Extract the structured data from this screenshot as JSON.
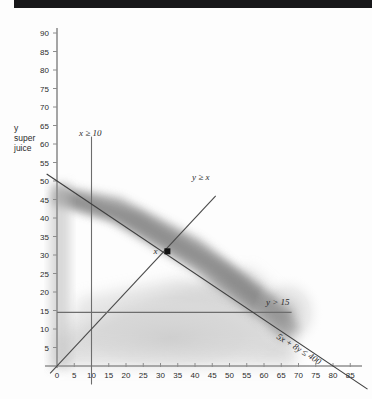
{
  "page": {
    "top_bar_color": "#18181a",
    "background_color": "#fdfdfd"
  },
  "chart_data": {
    "type": "scatter",
    "title": "",
    "subtitle": "",
    "xlabel": "",
    "ylabel": "y\nsuper\njuice",
    "ylabel_lines": [
      "y",
      "super",
      "juice"
    ],
    "xlim": [
      0,
      92
    ],
    "ylim": [
      0,
      93
    ],
    "xticks": [
      0,
      5,
      10,
      15,
      20,
      25,
      30,
      35,
      40,
      45,
      50,
      55,
      60,
      65,
      70,
      75,
      80,
      85
    ],
    "yticks": [
      5,
      10,
      15,
      20,
      25,
      30,
      35,
      40,
      45,
      50,
      55,
      60,
      65,
      70,
      75,
      80,
      85,
      90
    ],
    "grid": false,
    "legend_position": "inline-annotations",
    "axis_color": "#8c8c8c",
    "line_color": "#3a3a3a",
    "shade_color": "#b9b9b9",
    "constraint_lines": [
      {
        "name": "x-ge-10",
        "label": "x ≥ 10",
        "type": "vertical",
        "value": 10,
        "label_x": 14,
        "label_y": 62
      },
      {
        "name": "y-ge-x",
        "label": "y ≥ x",
        "type": "identity",
        "slope": 1,
        "intercept": 0,
        "label_x": 50,
        "label_y": 48
      },
      {
        "name": "y-ge-15",
        "label": "y > 15",
        "type": "horizontal",
        "value": 14.5,
        "label_x": 71,
        "label_y": 16
      },
      {
        "name": "budget",
        "label": "5x + 8y ≤ 400",
        "type": "oblique",
        "slope": -0.625,
        "intercept": 50,
        "x_intercept": 86,
        "y_intercept": 50,
        "label_x": 72,
        "label_y": 9,
        "label_rotation": 32
      }
    ],
    "points": [
      {
        "name": "optimum",
        "label": "x",
        "x": 32,
        "y": 31,
        "marker": "filled-square",
        "color": "#111111",
        "label_offset_x": -6,
        "label_offset_y": -1
      }
    ],
    "feasible_shading": {
      "description": "grey smudged feasible region",
      "color": "#bdbdbd"
    }
  }
}
